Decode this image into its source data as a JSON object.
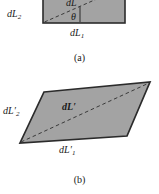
{
  "figure": {
    "background_color": "#ffffff",
    "shape_fill_color": "#a3a3a3",
    "shape_stroke_color": "#2b2b2b",
    "dashed_line_color": "#3a3a3a",
    "text_color": "#1a1a1a",
    "panels": [
      {
        "id": "a",
        "caption": "(a)",
        "shape": "rectangle",
        "labels": {
          "side_left": "dL",
          "side_left_sub": "2",
          "side_bottom": "dL",
          "side_bottom_sub": "1",
          "diagonal": "dL",
          "angle": "θ"
        }
      },
      {
        "id": "b",
        "caption": "(b)",
        "shape": "parallelogram",
        "labels": {
          "side_left": "dL",
          "side_left_prime": "′",
          "side_left_sub": "2",
          "side_bottom": "dL",
          "side_bottom_prime": "′",
          "side_bottom_sub": "1",
          "diagonal": "dL",
          "diagonal_prime": "′"
        }
      }
    ]
  }
}
